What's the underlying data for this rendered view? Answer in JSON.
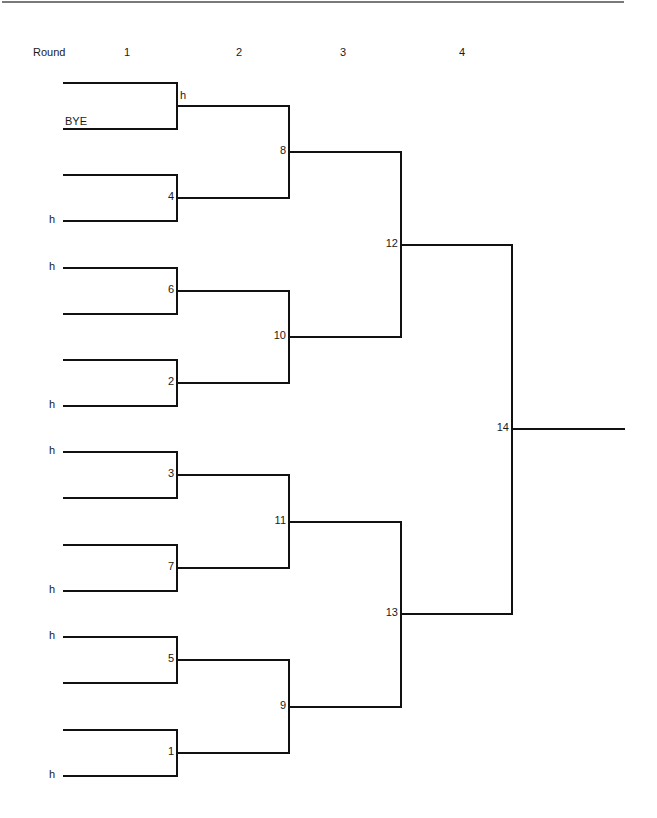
{
  "header": {
    "round_label": "Round",
    "rounds": [
      "1",
      "2",
      "3",
      "4"
    ]
  },
  "bracket": {
    "round1_entries": [
      {
        "slot": 1,
        "top_label": "",
        "bottom_label": "BYE",
        "match": "h"
      },
      {
        "slot": 2,
        "top_label": "",
        "bottom_label": "h",
        "match": "4"
      },
      {
        "slot": 3,
        "top_label": "h",
        "bottom_label": "",
        "match": "6"
      },
      {
        "slot": 4,
        "top_label": "",
        "bottom_label": "h",
        "match": "2"
      },
      {
        "slot": 5,
        "top_label": "h",
        "bottom_label": "",
        "match": "3"
      },
      {
        "slot": 6,
        "top_label": "",
        "bottom_label": "h",
        "match": "7"
      },
      {
        "slot": 7,
        "top_label": "h",
        "bottom_label": "",
        "match": "5"
      },
      {
        "slot": 8,
        "top_label": "",
        "bottom_label": "h",
        "match": "1"
      }
    ],
    "round2_matches": [
      "8",
      "10",
      "11",
      "9"
    ],
    "round3_matches": [
      "12",
      "13"
    ],
    "final_match": "14"
  }
}
